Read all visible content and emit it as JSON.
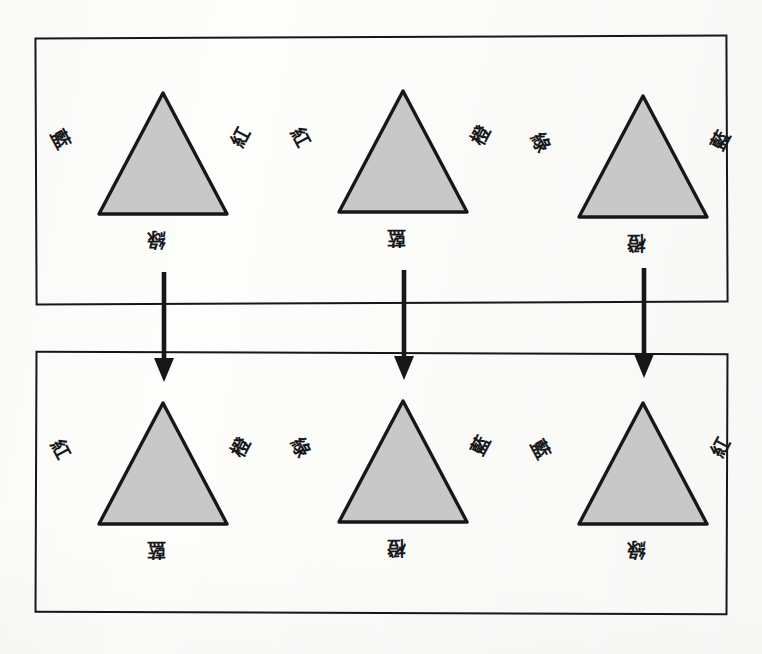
{
  "diagram": {
    "background_color": "#fdfdfc",
    "line_color": "#17171a",
    "triangle_fill": "#c8c8c8",
    "triangle_stroke": "#17171a",
    "groups": [
      {
        "id": "source-group",
        "name": "source-triangle-group",
        "triangles": [
          {
            "id": "source-triangle-1",
            "left_label": "藍",
            "right_label": "紅",
            "bottom_label": "綠"
          },
          {
            "id": "source-triangle-2",
            "left_label": "紅",
            "right_label": "橙",
            "bottom_label": "藍"
          },
          {
            "id": "source-triangle-3",
            "left_label": "綠",
            "right_label": "藍",
            "bottom_label": "橙"
          }
        ]
      },
      {
        "id": "target-group",
        "name": "target-triangle-group",
        "triangles": [
          {
            "id": "target-triangle-1",
            "left_label": "紅",
            "right_label": "橙",
            "bottom_label": "藍"
          },
          {
            "id": "target-triangle-2",
            "left_label": "綠",
            "right_label": "藍",
            "bottom_label": "橙"
          },
          {
            "id": "target-triangle-3",
            "left_label": "藍",
            "right_label": "紅",
            "bottom_label": "綠"
          }
        ]
      }
    ],
    "arrows": [
      {
        "id": "arrow-1",
        "icon": "down-arrow-icon"
      },
      {
        "id": "arrow-2",
        "icon": "down-arrow-icon"
      },
      {
        "id": "arrow-3",
        "icon": "down-arrow-icon"
      }
    ]
  }
}
